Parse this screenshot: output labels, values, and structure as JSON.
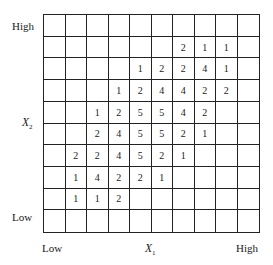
{
  "chart_data": {
    "type": "heatmap",
    "title": "",
    "xlabel": "X1",
    "ylabel": "X2",
    "x_tick_labels": {
      "low": "Low",
      "high": "High"
    },
    "y_tick_labels": {
      "low": "Low",
      "high": "High"
    },
    "n_rows": 10,
    "n_cols": 10,
    "grid_on": true,
    "rows_top_to_bottom": [
      [
        null,
        null,
        null,
        null,
        null,
        null,
        null,
        null,
        null,
        null
      ],
      [
        null,
        null,
        null,
        null,
        null,
        null,
        2,
        1,
        1,
        null
      ],
      [
        null,
        null,
        null,
        null,
        1,
        2,
        2,
        4,
        1,
        null
      ],
      [
        null,
        null,
        null,
        1,
        2,
        4,
        4,
        2,
        2,
        null
      ],
      [
        null,
        null,
        1,
        2,
        5,
        5,
        4,
        2,
        null,
        null
      ],
      [
        null,
        null,
        2,
        4,
        5,
        5,
        2,
        1,
        null,
        null
      ],
      [
        null,
        2,
        2,
        4,
        5,
        2,
        1,
        null,
        null,
        null
      ],
      [
        null,
        1,
        4,
        2,
        2,
        1,
        null,
        null,
        null,
        null
      ],
      [
        null,
        1,
        1,
        2,
        null,
        null,
        null,
        null,
        null,
        null
      ],
      [
        null,
        null,
        null,
        null,
        null,
        null,
        null,
        null,
        null,
        null
      ]
    ]
  },
  "labels": {
    "y_high": "High",
    "y_low": "Low",
    "x_low": "Low",
    "x_high": "High",
    "x_axis_var": "X",
    "x_axis_sub": "1",
    "y_axis_var": "X",
    "y_axis_sub": "2"
  }
}
